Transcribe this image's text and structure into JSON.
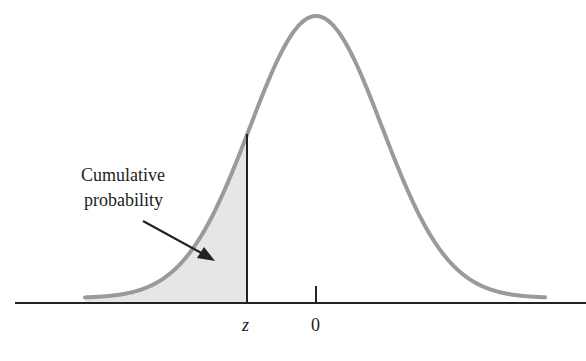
{
  "figure": {
    "annotation": {
      "line1": "Cumulative",
      "line2": "probability"
    },
    "axis_labels": {
      "z": "z",
      "zero": "0"
    },
    "colors": {
      "curve": "#9a9a9a",
      "shade": "#e6e6e6",
      "axis": "#222222"
    }
  },
  "chart_data": {
    "type": "area",
    "title": "",
    "xlabel": "",
    "ylabel": "",
    "x_ticks": [
      "z",
      "0"
    ],
    "shaded_region": "left of z",
    "annotations": [
      "Cumulative probability"
    ],
    "grid": false,
    "legend": null
  }
}
